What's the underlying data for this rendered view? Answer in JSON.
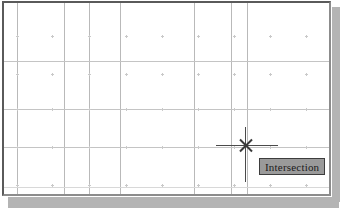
{
  "app": {
    "name": "CAD Drawing Window",
    "window_label": "drawing-area"
  },
  "drawing_area": {
    "background_color": "#ffffff",
    "grid_line_color": "#b9b9b9",
    "grid_dot_color": "#c9c9c9",
    "frame_border_color": "#5a5a5a",
    "shadow_color": "#b4b4b4",
    "vertical_grid_lines_x": [
      15,
      62,
      87,
      118,
      192,
      229,
      245
    ],
    "horizontal_grid_lines_y": [
      59,
      107,
      145
    ],
    "horizontal_faint_grid_lines_y": [
      185
    ],
    "grid_dot_columns_x": [
      15,
      50,
      87,
      124,
      160,
      196,
      232,
      268,
      304
    ],
    "grid_dot_rows_y": [
      34,
      72,
      107,
      145,
      183
    ]
  },
  "cursor": {
    "type": "crosshair",
    "center_x": 243,
    "center_y": 143,
    "vertical_extent": [
      125,
      180
    ],
    "horizontal_extent": [
      214,
      276
    ],
    "color": "#4a4a4a"
  },
  "osnap": {
    "marker_name": "intersection-marker",
    "marker_shape": "X",
    "marker_color": "#3a3a3a",
    "tooltip_label": "Intersection",
    "tooltip_background": "#9a9a9a",
    "tooltip_border": "#3d3d3d",
    "tooltip_text_color": "#1a1a1a"
  }
}
